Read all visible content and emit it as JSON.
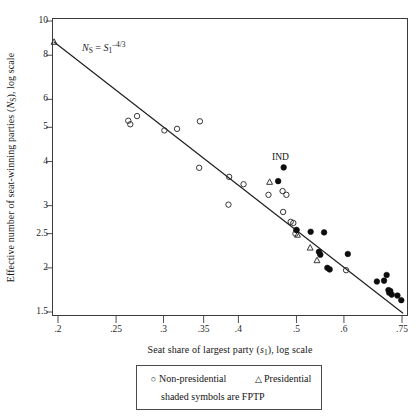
{
  "chart_data": {
    "type": "scatter",
    "title": "",
    "xlabel": "Seat share of largest party (s1), log scale",
    "ylabel": "Effective number of seat-winning parties (NS), log scale",
    "xscale": "log",
    "yscale": "log",
    "xlim": [
      0.19,
      0.78
    ],
    "ylim": [
      1.45,
      10.6
    ],
    "grid": false,
    "xticks": [
      ".2",
      ".25",
      ".3",
      ".35",
      ".4",
      ".5",
      ".6",
      ".75"
    ],
    "xtick_values": [
      0.2,
      0.25,
      0.3,
      0.35,
      0.4,
      0.5,
      0.6,
      0.75
    ],
    "yticks": [
      "10",
      "8",
      "6",
      "5",
      "4",
      "3",
      "2.5",
      "2",
      "1.5"
    ],
    "ytick_values": [
      10,
      8,
      6,
      5,
      4,
      3,
      2.5,
      2,
      1.5
    ],
    "legend_position": "below-axes",
    "annotations": [
      {
        "name": "model-formula",
        "text": "NS = S1^-4/3",
        "x": 0.245,
        "y": 7.7
      },
      {
        "name": "ind-point-label",
        "text": "IND",
        "x": 0.477,
        "y": 4.22
      }
    ],
    "reference_line": {
      "name": "ns-equals-s1-power",
      "label": "NS = S1^-4/3",
      "equation": "N_S = s_1^(-4/3)",
      "x_start": 0.197,
      "y_start": 8.72,
      "x_end": 0.752,
      "y_end": 1.49
    },
    "series": [
      {
        "name": "Non-presidential",
        "marker": "open-circle",
        "shaded": false,
        "points": [
          {
            "x": 0.262,
            "y": 5.22
          },
          {
            "x": 0.264,
            "y": 5.1
          },
          {
            "x": 0.271,
            "y": 5.38
          },
          {
            "x": 0.301,
            "y": 4.9
          },
          {
            "x": 0.316,
            "y": 4.95
          },
          {
            "x": 0.345,
            "y": 5.2
          },
          {
            "x": 0.344,
            "y": 3.84
          },
          {
            "x": 0.386,
            "y": 3.62
          },
          {
            "x": 0.385,
            "y": 3.02
          },
          {
            "x": 0.408,
            "y": 3.45
          },
          {
            "x": 0.449,
            "y": 3.22
          },
          {
            "x": 0.474,
            "y": 3.3
          },
          {
            "x": 0.481,
            "y": 3.22
          },
          {
            "x": 0.475,
            "y": 2.88
          },
          {
            "x": 0.489,
            "y": 2.7
          },
          {
            "x": 0.494,
            "y": 2.68
          },
          {
            "x": 0.5,
            "y": 2.56
          },
          {
            "x": 0.498,
            "y": 2.5
          },
          {
            "x": 0.605,
            "y": 1.97
          }
        ]
      },
      {
        "name": "Presidential",
        "marker": "open-triangle",
        "shaded": false,
        "points": [
          {
            "x": 0.197,
            "y": 8.72
          },
          {
            "x": 0.451,
            "y": 3.5
          },
          {
            "x": 0.502,
            "y": 2.48
          },
          {
            "x": 0.527,
            "y": 2.28
          },
          {
            "x": 0.541,
            "y": 2.1
          }
        ]
      },
      {
        "name": "Non-presidential FPTP",
        "marker": "filled-circle",
        "shaded": true,
        "points": [
          {
            "x": 0.476,
            "y": 3.85
          },
          {
            "x": 0.466,
            "y": 3.52
          },
          {
            "x": 0.5,
            "y": 2.56
          },
          {
            "x": 0.528,
            "y": 2.53
          },
          {
            "x": 0.556,
            "y": 2.52
          },
          {
            "x": 0.545,
            "y": 2.22
          },
          {
            "x": 0.548,
            "y": 2.18
          },
          {
            "x": 0.609,
            "y": 2.19
          },
          {
            "x": 0.563,
            "y": 2.0
          },
          {
            "x": 0.568,
            "y": 1.98
          },
          {
            "x": 0.681,
            "y": 1.83
          },
          {
            "x": 0.7,
            "y": 1.84
          },
          {
            "x": 0.707,
            "y": 1.91
          },
          {
            "x": 0.712,
            "y": 1.73
          },
          {
            "x": 0.714,
            "y": 1.7
          },
          {
            "x": 0.717,
            "y": 1.72
          },
          {
            "x": 0.721,
            "y": 1.68
          },
          {
            "x": 0.737,
            "y": 1.67
          },
          {
            "x": 0.748,
            "y": 1.62
          }
        ]
      }
    ]
  },
  "legend": {
    "entries": [
      {
        "glyph": "○",
        "icon": "open-circle-icon",
        "label": "Non-presidential"
      },
      {
        "glyph": "△",
        "icon": "open-triangle-icon",
        "label": "Presidential"
      }
    ],
    "note": "shaded symbols are FPTP"
  },
  "axis_labels": {
    "x_prefix": "Seat share of largest party (",
    "x_var": "s",
    "x_sub": "1",
    "x_suffix": "), log scale",
    "y_prefix": "Effective number of seat-winning parties (",
    "y_var": "N",
    "y_sub": "S",
    "y_suffix": "), log scale"
  },
  "formula": {
    "lhs_var": "N",
    "lhs_sub": "S",
    "eq": " = ",
    "rhs_var": "S",
    "rhs_sub": "1",
    "rhs_sup": "–4/3"
  },
  "ind_label": "IND",
  "colors": {
    "axis": "#3a3a3a",
    "line": "#232323",
    "marker_open": "#2c2c2c",
    "marker_filled": "#0d0d0d",
    "text": "#161616",
    "background": "#ffffff"
  }
}
